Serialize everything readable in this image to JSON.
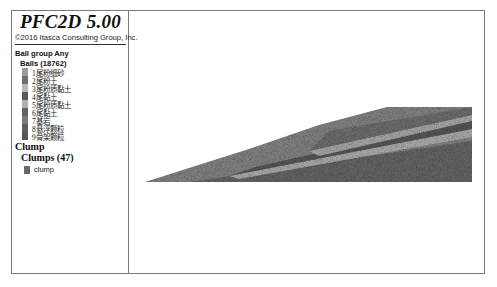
{
  "app": {
    "title": "PFC2D 5.00",
    "copyright": "©2016 Itasca Consulting Group, Inc."
  },
  "legend": {
    "group_heading": "Ball group Any",
    "balls_heading": "Balls (18762)",
    "ball_groups": [
      {
        "label": "1尾粉细砂",
        "color": "#9a9a9a"
      },
      {
        "label": "2尾粉土",
        "color": "#6e6e6e"
      },
      {
        "label": "3尾粉质黏土",
        "color": "#b8b8b8"
      },
      {
        "label": "4尾黏土",
        "color": "#5a5a5a"
      },
      {
        "label": "5尾粉质黏土",
        "color": "#b0b0b0"
      },
      {
        "label": "6尾黏土",
        "color": "#626262"
      },
      {
        "label": "7基岩",
        "color": "#7c7c7c"
      },
      {
        "label": "8悬浮颗粒",
        "color": "#5e5e5e"
      },
      {
        "label": "9骨架颗粒",
        "color": "#585858"
      }
    ],
    "clump_heading": "Clump",
    "clumps_heading": "Clumps (47)",
    "clump_items": [
      {
        "label": "clump",
        "color": "#6a6a6a"
      }
    ]
  },
  "viewport": {
    "description": "tailings dam particle model cross-section",
    "pile_fill": "#6b6b6b",
    "band_color": "#a8a8a8"
  }
}
